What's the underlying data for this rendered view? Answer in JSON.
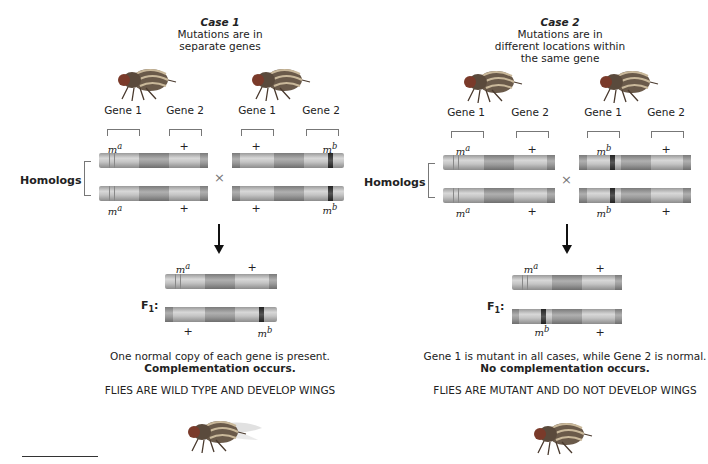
{
  "case1": {
    "heading": "Case 1",
    "subtitle_lines": [
      "Mutations are in",
      "separate genes"
    ],
    "parent_left": {
      "gene_labels": [
        "Gene 1",
        "Gene 2"
      ],
      "top_alleles": [
        "m",
        "+"
      ],
      "top_sup": [
        "a",
        ""
      ],
      "bottom_alleles": [
        "m",
        "+"
      ],
      "bottom_sup": [
        "a",
        ""
      ]
    },
    "parent_right": {
      "gene_labels": [
        "Gene 1",
        "Gene 2"
      ],
      "top_alleles": [
        "+",
        "m"
      ],
      "top_sup": [
        "",
        "b"
      ],
      "bottom_alleles": [
        "+",
        "m"
      ],
      "bottom_sup": [
        "",
        "b"
      ]
    },
    "homologs_label": "Homologs",
    "cross_symbol": "×",
    "f1_label": "F",
    "f1_sub": "1",
    "f1_top_alleles": [
      "m",
      "+"
    ],
    "f1_top_sup": [
      "a",
      ""
    ],
    "f1_bottom_alleles": [
      "+",
      "m"
    ],
    "f1_bottom_sup": [
      "",
      "b"
    ],
    "explanation": "One normal copy of each gene is present.",
    "conclusion": "Complementation occurs.",
    "result": "FLIES ARE WILD TYPE AND DEVELOP WINGS"
  },
  "case2": {
    "heading": "Case 2",
    "subtitle_lines": [
      "Mutations are in",
      "different locations within",
      "the same gene"
    ],
    "parent_left": {
      "gene_labels": [
        "Gene 1",
        "Gene 2"
      ],
      "top_alleles": [
        "m",
        "+"
      ],
      "top_sup": [
        "a",
        ""
      ],
      "bottom_alleles": [
        "m",
        "+"
      ],
      "bottom_sup": [
        "a",
        ""
      ]
    },
    "parent_right": {
      "gene_labels": [
        "Gene 1",
        "Gene 2"
      ],
      "top_alleles": [
        "m",
        "+"
      ],
      "top_sup": [
        "b",
        ""
      ],
      "bottom_alleles": [
        "m",
        "+"
      ],
      "bottom_sup": [
        "b",
        ""
      ]
    },
    "homologs_label": "Homologs",
    "cross_symbol": "×",
    "f1_label": "F",
    "f1_sub": "1",
    "f1_top_alleles": [
      "m",
      "+"
    ],
    "f1_top_sup": [
      "a",
      ""
    ],
    "f1_bottom_alleles": [
      "m",
      "+"
    ],
    "f1_bottom_sup": [
      "b",
      ""
    ],
    "explanation": "Gene 1 is mutant in all cases, while Gene 2 is normal.",
    "conclusion": "No complementation occurs.",
    "result": "FLIES ARE MUTANT AND DO NOT DEVELOP WINGS"
  },
  "colors": {
    "chromosome": "#c4c4c4",
    "mutation_band": "#222222",
    "text": "#222222"
  }
}
